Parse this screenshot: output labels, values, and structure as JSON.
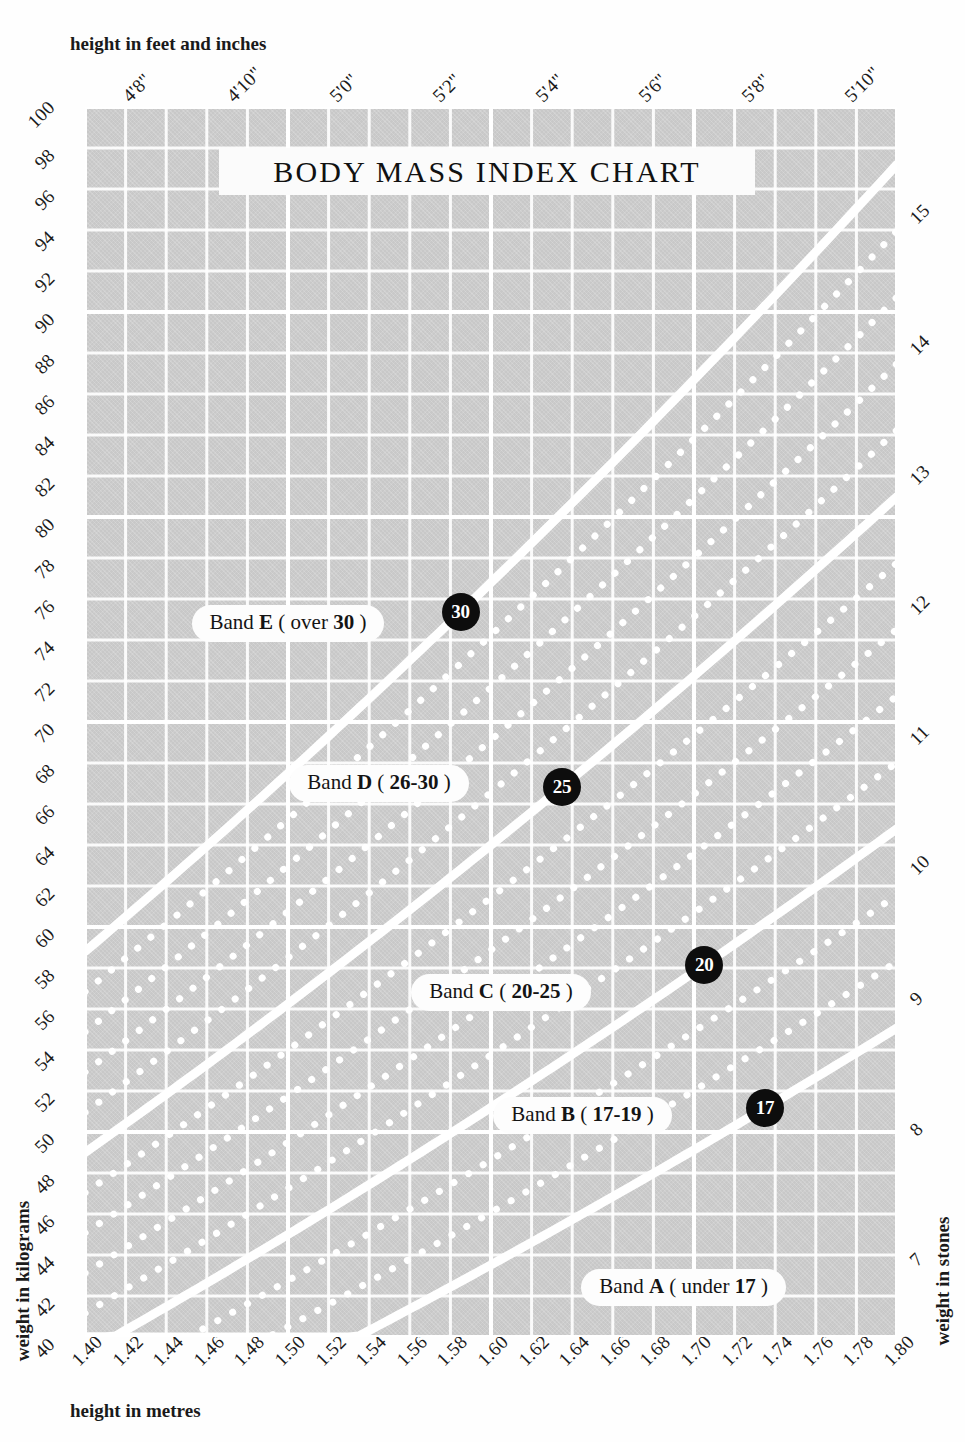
{
  "title": "BODY MASS INDEX CHART",
  "axes": {
    "top_title": "height in feet and inches",
    "bottom_title": "height in metres",
    "left_title": "weight in kilograms",
    "right_title": "weight in stones"
  },
  "chart_data": {
    "type": "line",
    "title": "BODY MASS INDEX CHART",
    "xlabel": "height in metres",
    "ylabel": "weight in kilograms",
    "xlim": [
      1.4,
      1.8
    ],
    "ylim": [
      40,
      100
    ],
    "grid": true,
    "legend_position": "inline-pills",
    "x_ticks": [
      "1.40",
      "1.42",
      "1.44",
      "1.46",
      "1.48",
      "1.50",
      "1.52",
      "1.54",
      "1.56",
      "1.58",
      "1.60",
      "1.62",
      "1.64",
      "1.66",
      "1.68",
      "1.70",
      "1.72",
      "1.74",
      "1.76",
      "1.78",
      "1.80"
    ],
    "y_ticks": [
      "40",
      "42",
      "44",
      "46",
      "48",
      "50",
      "52",
      "54",
      "56",
      "58",
      "60",
      "62",
      "64",
      "66",
      "68",
      "70",
      "72",
      "74",
      "76",
      "78",
      "80",
      "82",
      "84",
      "86",
      "88",
      "90",
      "92",
      "94",
      "96",
      "98",
      "100"
    ],
    "top_axis": {
      "label": "height in feet and inches",
      "ticks": [
        {
          "text": "4'8\"",
          "metres": 1.4224
        },
        {
          "text": "4'10\"",
          "metres": 1.4732
        },
        {
          "text": "5'0\"",
          "metres": 1.524
        },
        {
          "text": "5'2\"",
          "metres": 1.5748
        },
        {
          "text": "5'4\"",
          "metres": 1.6256
        },
        {
          "text": "5'6\"",
          "metres": 1.6764
        },
        {
          "text": "5'8\"",
          "metres": 1.7272
        },
        {
          "text": "5'10\"",
          "metres": 1.778
        }
      ]
    },
    "right_axis": {
      "label": "weight in stones",
      "ticks": [
        {
          "text": "7",
          "kg": 44.45
        },
        {
          "text": "8",
          "kg": 50.8
        },
        {
          "text": "9",
          "kg": 57.15
        },
        {
          "text": "10",
          "kg": 63.5
        },
        {
          "text": "11",
          "kg": 69.85
        },
        {
          "text": "12",
          "kg": 76.2
        },
        {
          "text": "13",
          "kg": 82.55
        },
        {
          "text": "14",
          "kg": 88.9
        },
        {
          "text": "15",
          "kg": 95.25
        }
      ]
    },
    "series": [
      {
        "name": "BMI 17",
        "bmi": 17,
        "style": "solid",
        "formula": "weight = 17 * height^2"
      },
      {
        "name": "BMI 18",
        "bmi": 18,
        "style": "dotted",
        "formula": "weight = 18 * height^2"
      },
      {
        "name": "BMI 19",
        "bmi": 19,
        "style": "dotted",
        "formula": "weight = 19 * height^2"
      },
      {
        "name": "BMI 20",
        "bmi": 20,
        "style": "solid",
        "formula": "weight = 20 * height^2"
      },
      {
        "name": "BMI 21",
        "bmi": 21,
        "style": "dotted",
        "formula": "weight = 21 * height^2"
      },
      {
        "name": "BMI 22",
        "bmi": 22,
        "style": "dotted",
        "formula": "weight = 22 * height^2"
      },
      {
        "name": "BMI 23",
        "bmi": 23,
        "style": "dotted",
        "formula": "weight = 23 * height^2"
      },
      {
        "name": "BMI 24",
        "bmi": 24,
        "style": "dotted",
        "formula": "weight = 24 * height^2"
      },
      {
        "name": "BMI 25",
        "bmi": 25,
        "style": "solid",
        "formula": "weight = 25 * height^2"
      },
      {
        "name": "BMI 26",
        "bmi": 26,
        "style": "dotted",
        "formula": "weight = 26 * height^2"
      },
      {
        "name": "BMI 27",
        "bmi": 27,
        "style": "dotted",
        "formula": "weight = 27 * height^2"
      },
      {
        "name": "BMI 28",
        "bmi": 28,
        "style": "dotted",
        "formula": "weight = 28 * height^2"
      },
      {
        "name": "BMI 29",
        "bmi": 29,
        "style": "dotted",
        "formula": "weight = 29 * height^2"
      },
      {
        "name": "BMI 30",
        "bmi": 30,
        "style": "solid",
        "formula": "weight = 30 * height^2"
      }
    ],
    "bands": [
      {
        "id": "E",
        "label_prefix": "Band ",
        "letter": "E",
        "range_text": "(over 30)",
        "badge": "30",
        "badge_bmi": 30,
        "badge_height": 1.585,
        "label_height": 1.5,
        "label_kg": 74.8
      },
      {
        "id": "D",
        "label_prefix": "Band ",
        "letter": "D",
        "range_text": "(26-30)",
        "badge": "25",
        "badge_bmi": 25,
        "badge_height": 1.635,
        "label_height": 1.545,
        "label_kg": 67.0
      },
      {
        "id": "C",
        "label_prefix": "Band ",
        "letter": "C",
        "range_text": "(20-25)",
        "badge": "20",
        "badge_bmi": 20,
        "badge_height": 1.705,
        "label_height": 1.605,
        "label_kg": 56.8
      },
      {
        "id": "B",
        "label_prefix": "Band ",
        "letter": "B",
        "range_text": "(17-19)",
        "badge": "17",
        "badge_bmi": 17,
        "badge_height": 1.735,
        "label_height": 1.645,
        "label_kg": 50.8
      },
      {
        "id": "A",
        "label_prefix": "Band ",
        "letter": "A",
        "range_text": "(under 17)",
        "badge": null,
        "badge_bmi": null,
        "badge_height": null,
        "label_height": 1.695,
        "label_kg": 42.4
      }
    ]
  },
  "colors": {
    "plot_background": "#c8c8c8",
    "grid_line": "#ffffff",
    "bmi_line": "#ffffff",
    "badge_background": "#0d0d0d",
    "badge_text": "#ffffff",
    "pill_background": "#fdfdfd",
    "text": "#1a1a1a",
    "page_background": "#fefefe"
  }
}
